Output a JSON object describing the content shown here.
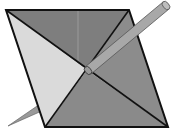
{
  "diagram": {
    "colors": {
      "background": "#ffffff",
      "light_triangle": "#d8d8d8",
      "dark_triangle": "#8a8a8a",
      "top_triangle": "#7e7e7e",
      "outline": "#111111",
      "pencil_body": "#a9a9a9",
      "pencil_edge": "#555555"
    },
    "vertices": {
      "top_left": [
        6,
        10
      ],
      "top_right": [
        129,
        10
      ],
      "bottom_right": [
        168,
        127
      ],
      "bottom_left": [
        45,
        127
      ],
      "center": [
        87,
        70
      ]
    },
    "pencil": {
      "back_end": [
        166,
        5
      ],
      "tip": [
        8,
        126
      ]
    }
  }
}
